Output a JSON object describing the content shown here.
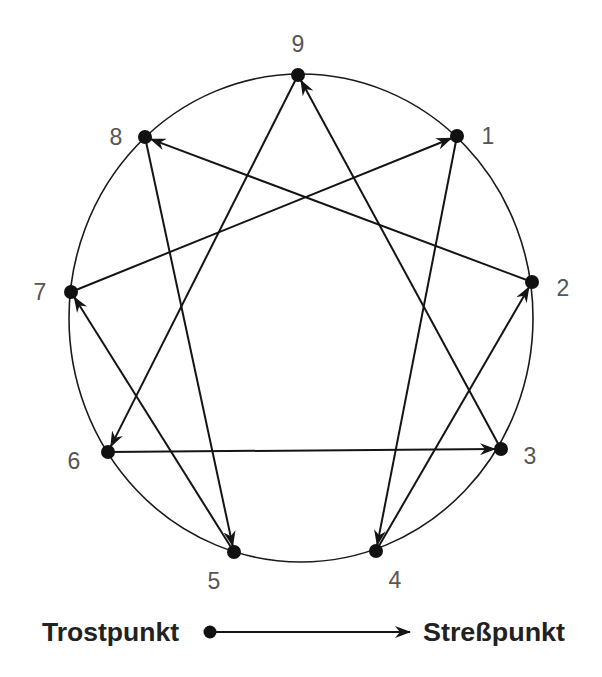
{
  "diagram": {
    "title": "",
    "shape": "enneagram",
    "ring": {
      "cx": 301,
      "cy": 318,
      "rx": 232,
      "ry": 244
    },
    "nodes": [
      {
        "id": "9",
        "label": "9",
        "x": 298,
        "y": 75,
        "lx": 298,
        "ly": 44
      },
      {
        "id": "1",
        "label": "1",
        "x": 457,
        "y": 136,
        "lx": 488,
        "ly": 136
      },
      {
        "id": "2",
        "label": "2",
        "x": 532,
        "y": 282,
        "lx": 563,
        "ly": 288
      },
      {
        "id": "3",
        "label": "3",
        "x": 501,
        "y": 449,
        "lx": 530,
        "ly": 456
      },
      {
        "id": "4",
        "label": "4",
        "x": 376,
        "y": 551,
        "lx": 395,
        "ly": 580
      },
      {
        "id": "5",
        "label": "5",
        "x": 234,
        "y": 552,
        "lx": 214,
        "ly": 581
      },
      {
        "id": "6",
        "label": "6",
        "x": 108,
        "y": 452,
        "lx": 74,
        "ly": 461
      },
      {
        "id": "7",
        "label": "7",
        "x": 71,
        "y": 292,
        "lx": 40,
        "ly": 292
      },
      {
        "id": "8",
        "label": "8",
        "x": 145,
        "y": 137,
        "lx": 116,
        "ly": 137
      }
    ],
    "edges": [
      {
        "from": "9",
        "to": "6"
      },
      {
        "from": "6",
        "to": "3"
      },
      {
        "from": "3",
        "to": "9"
      },
      {
        "from": "1",
        "to": "4"
      },
      {
        "from": "4",
        "to": "2"
      },
      {
        "from": "2",
        "to": "8"
      },
      {
        "from": "8",
        "to": "5"
      },
      {
        "from": "5",
        "to": "7"
      },
      {
        "from": "7",
        "to": "1"
      }
    ]
  },
  "legend": {
    "from_label": "Trostpunkt",
    "to_label": "Streßpunkt"
  }
}
